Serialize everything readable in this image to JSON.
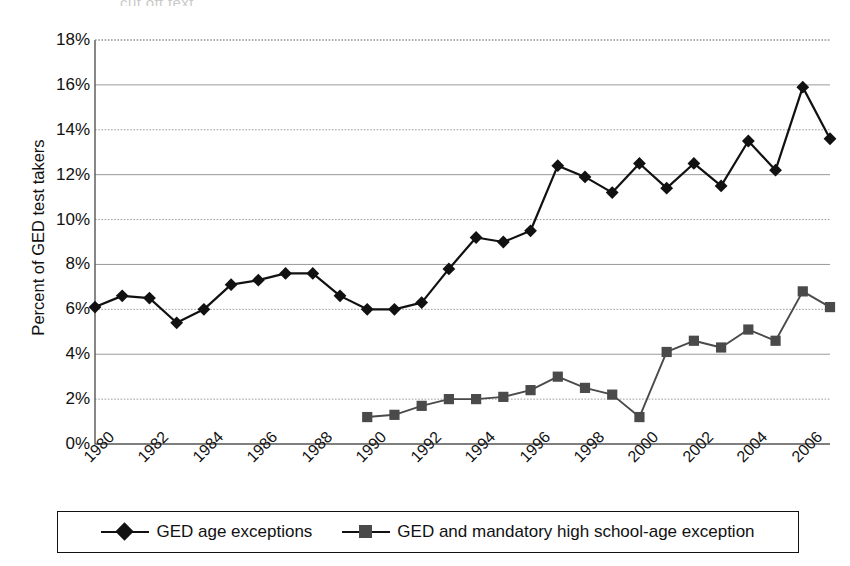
{
  "chart_data": {
    "type": "line",
    "title": "",
    "xlabel": "",
    "ylabel": "Percent of GED test takers",
    "ylim": [
      0,
      18
    ],
    "ytick_labels": [
      "0%",
      "2%",
      "4%",
      "6%",
      "8%",
      "10%",
      "12%",
      "14%",
      "16%",
      "18%"
    ],
    "ytick_values": [
      0,
      2,
      4,
      6,
      8,
      10,
      12,
      14,
      16,
      18
    ],
    "xlim": [
      1980,
      2007
    ],
    "xtick_labels": [
      "1980",
      "1982",
      "1984",
      "1986",
      "1988",
      "1990",
      "1992",
      "1994",
      "1996",
      "1998",
      "2000",
      "2002",
      "2004",
      "2006"
    ],
    "xtick_values": [
      1980,
      1982,
      1984,
      1986,
      1988,
      1990,
      1992,
      1994,
      1996,
      1998,
      2000,
      2002,
      2004,
      2006
    ],
    "x": [
      1980,
      1981,
      1982,
      1983,
      1984,
      1985,
      1986,
      1987,
      1988,
      1989,
      1990,
      1991,
      1992,
      1993,
      1994,
      1995,
      1996,
      1997,
      1998,
      1999,
      2000,
      2001,
      2002,
      2003,
      2004,
      2005,
      2006,
      2007
    ],
    "grid": true,
    "grid_axis": "y",
    "legend_position": "bottom",
    "series": [
      {
        "name": "GED age exceptions",
        "marker": "diamond",
        "color": "#111111",
        "x": [
          1980,
          1981,
          1982,
          1983,
          1984,
          1985,
          1986,
          1987,
          1988,
          1989,
          1990,
          1991,
          1992,
          1993,
          1994,
          1995,
          1996,
          1997,
          1998,
          1999,
          2000,
          2001,
          2002,
          2003,
          2004,
          2005,
          2006,
          2007
        ],
        "values": [
          6.1,
          6.6,
          6.5,
          5.4,
          6.0,
          7.1,
          7.3,
          7.6,
          7.6,
          6.6,
          6.0,
          6.0,
          6.3,
          7.8,
          9.2,
          9.0,
          9.5,
          12.4,
          11.9,
          11.2,
          12.5,
          11.4,
          12.5,
          11.5,
          13.5,
          12.2,
          15.9,
          13.6
        ]
      },
      {
        "name": "GED and mandatory high school-age exception",
        "marker": "square",
        "color": "#4a4a4a",
        "x": [
          1990,
          1991,
          1992,
          1993,
          1994,
          1995,
          1996,
          1997,
          1998,
          1999,
          2000,
          2001,
          2002,
          2003,
          2004,
          2005,
          2006,
          2007
        ],
        "values": [
          1.2,
          1.3,
          1.7,
          2.0,
          2.0,
          2.1,
          2.4,
          3.0,
          2.5,
          2.2,
          1.2,
          4.1,
          4.6,
          4.3,
          5.1,
          4.6,
          6.8,
          6.1
        ]
      }
    ]
  },
  "axis": {
    "y_title": "Percent of GED test takers"
  },
  "legend": {
    "items": [
      {
        "label": "GED age exceptions",
        "marker": "diamond-marker-icon"
      },
      {
        "label": "GED and mandatory high school-age exception",
        "marker": "square-marker-icon"
      }
    ]
  },
  "colors": {
    "series_diamond": "#111111",
    "series_square": "#4a4a4a",
    "gridline": "#9a9a9a",
    "axis": "#555555",
    "text": "#111111",
    "background": "#ffffff"
  },
  "top_artifact": "cut off text"
}
